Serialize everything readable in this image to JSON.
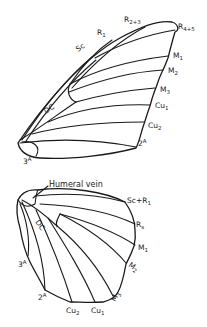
{
  "figure": {
    "line_color": "#1a1a1a",
    "background": "#ffffff"
  },
  "forewing": {
    "labels": {
      "sc": {
        "main": "Sc",
        "sub": ""
      },
      "r1": {
        "main": "R",
        "sub": "1"
      },
      "r23": {
        "main": "R",
        "sub": "2+3"
      },
      "r45": {
        "main": "R",
        "sub": "4+5"
      },
      "m1": {
        "main": "M",
        "sub": "1"
      },
      "m2": {
        "main": "M",
        "sub": "2"
      },
      "m3": {
        "main": "M",
        "sub": "3"
      },
      "cu1": {
        "main": "Cu",
        "sub": "1"
      },
      "cu2": {
        "main": "Cu",
        "sub": "2"
      },
      "a2": {
        "main": "2",
        "sub": "A"
      },
      "a3": {
        "main": "3",
        "sub": "A"
      },
      "dc": {
        "main": "DC",
        "sub": ""
      }
    }
  },
  "hindwing": {
    "labels": {
      "humeral": {
        "main": "Humeral vein",
        "sub": ""
      },
      "dc": {
        "main": "DC",
        "sub": ""
      },
      "scr1": {
        "main": "Sc+R",
        "sub": "1"
      },
      "rs": {
        "main": "R",
        "sub": "s"
      },
      "m1": {
        "main": "M",
        "sub": "1"
      },
      "m2": {
        "main": "M",
        "sub": "2"
      },
      "m3": {
        "main": "M",
        "sub": "3"
      },
      "cu1": {
        "main": "Cu",
        "sub": "1"
      },
      "cu2": {
        "main": "Cu",
        "sub": "2"
      },
      "a2": {
        "main": "2",
        "sub": "A"
      },
      "a3": {
        "main": "3",
        "sub": "A"
      }
    }
  }
}
